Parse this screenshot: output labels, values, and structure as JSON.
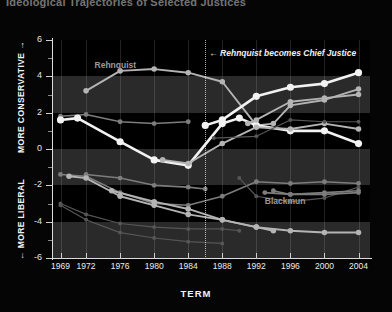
{
  "title": "Ideological Trajectories of Selected Justices",
  "axis": {
    "x_title": "TERM",
    "y_caption_top": "MORE CONSERVATIVE →",
    "y_caption_bottom": "← MORE LIBERAL"
  },
  "annotations": {
    "event": "← Rehnquist becomes Chief Justice",
    "rehnquist": "Rehnquist",
    "blackmun": "Blackmun"
  },
  "colors": {
    "background": "#000000",
    "band": "#2a2a2a",
    "axis": "#dcdcdc",
    "bright_line": "#f2f2f2",
    "mid_line": "#b4b4b4",
    "dim_line": "#7d7d7d",
    "faint_line": "#565656"
  },
  "chart_data": {
    "type": "line",
    "title": "Ideological Trajectories of Selected Justices",
    "xlabel": "TERM",
    "ylabel": "",
    "xlim": [
      1968,
      2005
    ],
    "ylim": [
      -6,
      6
    ],
    "yticks": [
      -6,
      -4,
      -2,
      0,
      2,
      4,
      6
    ],
    "xticks": [
      1969,
      1972,
      1976,
      1980,
      1984,
      1988,
      1992,
      1996,
      2000,
      2004
    ],
    "grid": "horizontal-bands",
    "legend": "none",
    "event_marker": {
      "x": 1986,
      "label": "Rehnquist becomes Chief Justice"
    },
    "series": [
      {
        "name": "Rehnquist",
        "shade": "mid_line",
        "label_x": 1973,
        "label_y": 4.9,
        "x": [
          1972,
          1976,
          1980,
          1984,
          1988,
          1992,
          1994,
          1996,
          2000,
          2004
        ],
        "y": [
          3.2,
          4.3,
          4.4,
          4.2,
          3.7,
          1.3,
          1.4,
          2.4,
          2.7,
          3.3
        ]
      },
      {
        "name": "Scalia",
        "shade": "bright_line",
        "x": [
          1986,
          1988,
          1992,
          1996,
          2000,
          2004
        ],
        "y": [
          1.3,
          1.6,
          2.9,
          3.4,
          3.6,
          4.2
        ]
      },
      {
        "name": "Burger",
        "shade": "dim_line",
        "x": [
          1969,
          1972,
          1976,
          1980,
          1984
        ],
        "y": [
          1.8,
          1.9,
          1.5,
          1.4,
          1.5
        ]
      },
      {
        "name": "White",
        "shade": "bright_line",
        "x": [
          1969,
          1971,
          1976,
          1980,
          1984,
          1988,
          1990,
          1992,
          1996,
          2000,
          2004
        ],
        "y": [
          1.6,
          1.7,
          0.4,
          -0.6,
          -0.9,
          1.4,
          1.7,
          1.3,
          1.0,
          1.0,
          0.3
        ]
      },
      {
        "name": "O'Connor",
        "shade": "mid_line",
        "x": [
          1981,
          1984,
          1988,
          1992,
          1996,
          2000,
          2004
        ],
        "y": [
          -0.6,
          -0.8,
          0.3,
          1.2,
          1.1,
          1.4,
          1.1
        ]
      },
      {
        "name": "Powell",
        "shade": "dim_line",
        "x": [
          1972,
          1976,
          1980,
          1984,
          1986
        ],
        "y": [
          -1.4,
          -1.6,
          -2.0,
          -2.1,
          -2.2
        ]
      },
      {
        "name": "Stewart",
        "shade": "dim_line",
        "x": [
          1969,
          1972,
          1976,
          1980,
          1984,
          1988,
          1992,
          1996,
          2000,
          2004
        ],
        "y": [
          -1.4,
          -1.5,
          -2.4,
          -3.0,
          -3.1,
          -2.6,
          -1.8,
          -1.9,
          -1.8,
          -1.9
        ]
      },
      {
        "name": "Blackmun",
        "shade": "mid_line",
        "label_x": 1993,
        "label_y": -2.6,
        "x": [
          1970,
          1972,
          1976,
          1980,
          1984,
          1988,
          1992,
          1994
        ],
        "y": [
          -1.5,
          -1.6,
          -2.6,
          -3.1,
          -3.6,
          -3.9,
          -4.3,
          -4.5
        ]
      },
      {
        "name": "Stevens",
        "shade": "mid_line",
        "x": [
          1975,
          1980,
          1984,
          1988,
          1992,
          1996,
          2000,
          2004
        ],
        "y": [
          -2.3,
          -2.9,
          -3.3,
          -3.9,
          -4.3,
          -4.5,
          -4.6,
          -4.6
        ]
      },
      {
        "name": "Marshall",
        "shade": "faint_line",
        "x": [
          1969,
          1972,
          1976,
          1980,
          1984,
          1988,
          1990
        ],
        "y": [
          -3.0,
          -3.6,
          -4.1,
          -4.3,
          -4.4,
          -4.4,
          -4.5
        ]
      },
      {
        "name": "Brennan",
        "shade": "faint_line",
        "x": [
          1969,
          1972,
          1976,
          1980,
          1984,
          1988
        ],
        "y": [
          -3.1,
          -3.9,
          -4.6,
          -4.9,
          -5.1,
          -5.2
        ]
      },
      {
        "name": "Souter",
        "shade": "faint_line",
        "x": [
          1990,
          1992,
          1996,
          2000,
          2004
        ],
        "y": [
          -1.6,
          -2.6,
          -2.9,
          -2.7,
          -2.1
        ]
      },
      {
        "name": "Kennedy",
        "shade": "faint_line",
        "x": [
          1987,
          1992,
          1996,
          2000,
          2004
        ],
        "y": [
          0.6,
          0.7,
          1.6,
          1.5,
          1.5
        ]
      },
      {
        "name": "Thomas",
        "shade": "mid_line",
        "x": [
          1991,
          1992,
          1996,
          2000,
          2004
        ],
        "y": [
          1.4,
          1.6,
          2.6,
          2.8,
          3.0
        ]
      },
      {
        "name": "Ginsburg",
        "shade": "dim_line",
        "x": [
          1993,
          1996,
          2000,
          2004
        ],
        "y": [
          -2.4,
          -2.5,
          -2.4,
          -2.3
        ]
      },
      {
        "name": "Breyer",
        "shade": "dim_line",
        "x": [
          1994,
          1996,
          2000,
          2004
        ],
        "y": [
          -2.3,
          -2.5,
          -2.5,
          -2.4
        ]
      }
    ]
  }
}
